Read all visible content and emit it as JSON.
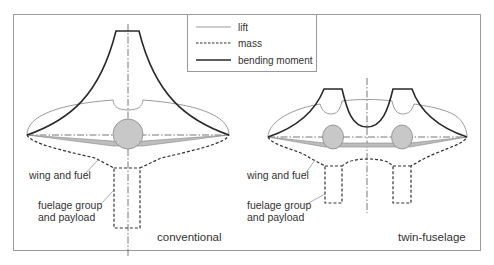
{
  "legend": {
    "items": [
      {
        "label": "lift",
        "style": "thin-grey"
      },
      {
        "label": "mass",
        "style": "dashed"
      },
      {
        "label": "bending moment",
        "style": "thick-dark"
      }
    ]
  },
  "panels": [
    {
      "id": "conventional",
      "title": "conventional",
      "annotations": [
        "wing and fuel",
        "fuelage group",
        "and payload"
      ]
    },
    {
      "id": "twin-fuselage",
      "title": "twin-fuselage",
      "annotations": [
        "wing and fuel",
        "fuelage group",
        "and payload"
      ]
    }
  ],
  "colors": {
    "frame": "#999999",
    "lift": "#9a9a9a",
    "mass": "#333333",
    "bending": "#2a2a2a",
    "fuselage_fill": "#c8c8c8",
    "wing_fill": "#bdbdbd",
    "text": "#333333"
  }
}
